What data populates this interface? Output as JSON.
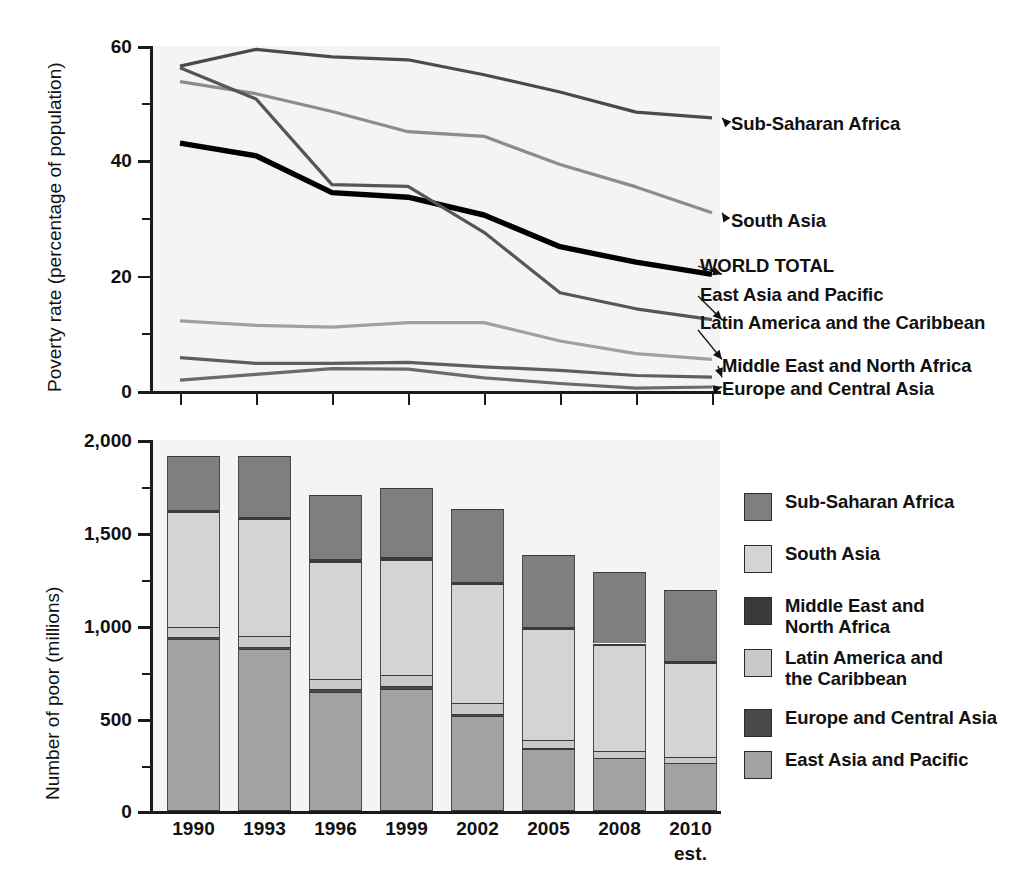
{
  "chart_data": [
    {
      "type": "line",
      "title": "",
      "xlabel": "",
      "ylabel": "Poverty rate (percentage of population)",
      "ylim": [
        0,
        60
      ],
      "yticks": [
        0,
        20,
        40,
        60
      ],
      "yticks_minor": [
        10,
        30,
        50
      ],
      "ytick_labels": [
        "0",
        "20",
        "40",
        "60"
      ],
      "x": [
        "1990",
        "1993",
        "1996",
        "1999",
        "2002",
        "2005",
        "2008",
        "2010"
      ],
      "grid": false,
      "legend_position": "right-inline-arrows",
      "series": [
        {
          "name": "Sub-Saharan Africa",
          "color": "#4a4a4a",
          "width": 3.2,
          "values": [
            56.5,
            59.4,
            58.1,
            57.6,
            55.0,
            52.0,
            48.5,
            47.5
          ]
        },
        {
          "name": "South Asia",
          "color": "#8c8c8c",
          "width": 3.2,
          "values": [
            53.8,
            51.7,
            48.6,
            45.1,
            44.3,
            39.4,
            35.5,
            31.0
          ]
        },
        {
          "name": "WORLD TOTAL",
          "color": "#000000",
          "width": 5.4,
          "values": [
            43.1,
            40.9,
            34.5,
            33.7,
            30.6,
            25.1,
            22.4,
            20.3
          ]
        },
        {
          "name": "East Asia and Pacific",
          "color": "#565656",
          "width": 3.2,
          "values": [
            56.2,
            50.8,
            35.9,
            35.6,
            27.6,
            17.1,
            14.3,
            12.4
          ]
        },
        {
          "name": "Latin America and the Caribbean",
          "color": "#a0a0a0",
          "width": 3.2,
          "values": [
            12.2,
            11.4,
            11.1,
            11.9,
            11.9,
            8.7,
            6.5,
            5.5
          ]
        },
        {
          "name": "Middle East and North Africa",
          "color": "#5e5e5e",
          "width": 3.2,
          "values": [
            5.8,
            4.8,
            4.8,
            5.0,
            4.2,
            3.6,
            2.7,
            2.4
          ]
        },
        {
          "name": "Europe and Central Asia",
          "color": "#6b6b6b",
          "width": 3.2,
          "values": [
            1.9,
            2.9,
            3.9,
            3.8,
            2.3,
            1.3,
            0.5,
            0.7
          ]
        }
      ]
    },
    {
      "type": "bar",
      "subtype": "stacked",
      "title": "",
      "xlabel": "",
      "ylabel": "Number of poor (millions)",
      "ylim": [
        0,
        2000
      ],
      "yticks": [
        0,
        500,
        1000,
        1500,
        2000
      ],
      "yticks_minor": [
        250,
        750,
        1250,
        1750
      ],
      "ytick_labels": [
        "0",
        "500",
        "1,000",
        "1,500",
        "2,000"
      ],
      "categories": [
        "1990",
        "1993",
        "1996",
        "1999",
        "2002",
        "2005",
        "2008",
        "2010"
      ],
      "category_sublabels": [
        "",
        "",
        "",
        "",
        "",
        "",
        "",
        "est."
      ],
      "grid": false,
      "legend_position": "right",
      "stack_order_bottom_to_top": [
        "East Asia and Pacific",
        "Europe and Central Asia",
        "Latin America and the Caribbean",
        "South Asia",
        "Middle East and North Africa",
        "Sub-Saharan Africa"
      ],
      "series": [
        {
          "name": "East Asia and Pacific",
          "color": "#a2a2a2",
          "values": [
            926,
            871,
            639,
            656,
            511,
            332,
            284,
            257
          ]
        },
        {
          "name": "Europe and Central Asia",
          "color": "#4a4a4a",
          "values": [
            10,
            15,
            19,
            18,
            11,
            6,
            2,
            3
          ]
        },
        {
          "name": "Latin America and the Caribbean",
          "color": "#c9c9c9",
          "values": [
            58,
            55,
            54,
            60,
            62,
            47,
            37,
            32
          ]
        },
        {
          "name": "South Asia",
          "color": "#d4d4d4",
          "values": [
            617,
            632,
            631,
            619,
            640,
            598,
            571,
            507
          ]
        },
        {
          "name": "Middle East and North Africa",
          "color": "#3a3a3a",
          "values": [
            13,
            12,
            13,
            14,
            12,
            10,
            9,
            8
          ]
        },
        {
          "name": "Sub-Saharan Africa",
          "color": "#7f7f7f",
          "values": [
            290,
            330,
            349,
            376,
            390,
            388,
            386,
            386
          ]
        }
      ],
      "totals": [
        1914,
        1915,
        1705,
        1743,
        1626,
        1381,
        1289,
        1193
      ]
    }
  ],
  "line_chart": {
    "y_axis_title": "Poverty rate (percentage of population)",
    "y_tick_labels": [
      "60",
      "40",
      "20",
      "0"
    ],
    "annotations": [
      {
        "label": "Sub-Saharan Africa"
      },
      {
        "label": "South Asia"
      },
      {
        "label": "WORLD TOTAL"
      },
      {
        "label": "East Asia and Pacific"
      },
      {
        "label": "Latin America and\nthe Caribbean"
      },
      {
        "label": "Middle East and North Africa"
      },
      {
        "label": "Europe and Central Asia"
      }
    ]
  },
  "bar_chart": {
    "y_axis_title": "Number of poor (millions)",
    "y_tick_labels": [
      "2,000",
      "1,500",
      "1,000",
      "500",
      "0"
    ],
    "x_tick_labels": [
      "1990",
      "1993",
      "1996",
      "1999",
      "2002",
      "2005",
      "2008",
      "2010"
    ],
    "x_tick_sublabel": "est.",
    "legend": [
      {
        "label": "Sub-Saharan Africa",
        "color": "#7f7f7f"
      },
      {
        "label": "South Asia",
        "color": "#d4d4d4"
      },
      {
        "label": "Middle East and\nNorth Africa",
        "color": "#3a3a3a"
      },
      {
        "label": "Latin America and\nthe Caribbean",
        "color": "#c9c9c9"
      },
      {
        "label": "Europe and Central Asia",
        "color": "#4a4a4a"
      },
      {
        "label": "East Asia and Pacific",
        "color": "#a2a2a2"
      }
    ]
  },
  "colors": {
    "plot_background": "#f4f4f4",
    "page_background": "#ffffff",
    "axis": "#1a1a1a",
    "world_total": "#000000"
  },
  "caption": {
    "text": ""
  }
}
